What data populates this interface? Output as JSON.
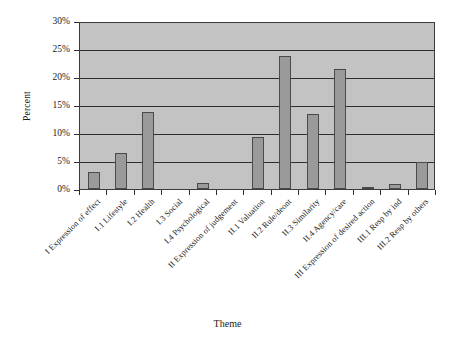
{
  "chart_data": {
    "type": "bar",
    "title": "",
    "xlabel": "Theme",
    "ylabel": "Percent",
    "ylim": [
      0,
      30
    ],
    "ytick_labels": [
      "0%",
      "5%",
      "10%",
      "15%",
      "20%",
      "25%",
      "30%"
    ],
    "ytick_values": [
      0,
      5,
      10,
      15,
      20,
      25,
      30
    ],
    "grid": "horizontal",
    "legend": "none",
    "categories": [
      "I Expression of effect",
      "I.1 Lifestyle",
      "I.2 Health",
      "I.3 Social",
      "I.4 Psychological",
      "II Expression of judgement",
      "II.1 Valuation",
      "II.2 Rule/deont",
      "II.3 Similarity",
      "II.4 Agency/care",
      "III Expression of desired action",
      "III.1 Resp by ind",
      "III.2 Resp by others"
    ],
    "values": [
      3.1,
      6.4,
      13.8,
      0,
      1.0,
      0,
      9.3,
      23.8,
      13.4,
      21.5,
      0.25,
      0.9,
      4.8
    ],
    "units": "percent"
  },
  "style": {
    "plot_background": "#c3c3c3",
    "bar_fill": "#9a9a9a",
    "bar_border": "#4a4a4a",
    "gridline_color": "#2e2e2e",
    "axis_color": "#2e2e2e",
    "text_color": "#1a1a1a",
    "page_background": "#ffffff"
  }
}
